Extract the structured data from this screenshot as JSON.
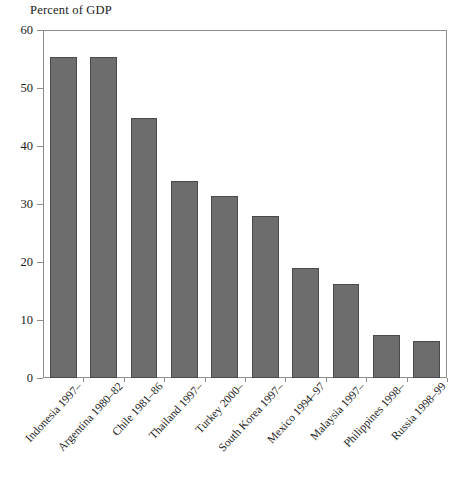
{
  "chart_data": {
    "type": "bar",
    "title": "Percent of GDP",
    "xlabel": "",
    "ylabel": "",
    "ylim": [
      0,
      60
    ],
    "yticks": [
      0,
      10,
      20,
      30,
      40,
      50,
      60
    ],
    "grid": false,
    "legend": null,
    "bar_color": "#6d6d6d",
    "bar_edge_color": "#4a4a4a",
    "categories": [
      "Indonesia 1997–",
      "Argentina 1980–82",
      "Chile 1981–86",
      "Thailand 1997–",
      "Turkey 2000–",
      "South Korea 1997–",
      "Mexico 1994–97",
      "Malaysia 1997–",
      "Philippines 1998–",
      "Russia 1998–99"
    ],
    "values": [
      55.3,
      55.3,
      44.8,
      34.0,
      31.4,
      28.0,
      19.0,
      16.2,
      7.5,
      6.3
    ]
  }
}
